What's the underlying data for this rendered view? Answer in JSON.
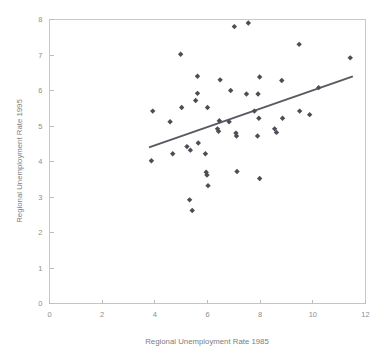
{
  "chart_data": {
    "type": "scatter",
    "title": "",
    "xlabel": "Regional Unemployment Rate 1985",
    "ylabel": "Regional Unemployment Rate 1995",
    "xlim": [
      0,
      12
    ],
    "ylim": [
      0,
      8
    ],
    "xticks": [
      0,
      2,
      4,
      6,
      8,
      10,
      12
    ],
    "yticks": [
      0,
      1,
      2,
      3,
      4,
      5,
      6,
      7,
      8
    ],
    "xtick_labels": [
      "0",
      "2",
      "4",
      "6",
      "8",
      "10",
      "12"
    ],
    "ytick_labels": [
      "0",
      "1",
      "2",
      "3",
      "4",
      "5",
      "6",
      "7",
      "8"
    ],
    "grid": false,
    "legend": null,
    "legend_position": "none",
    "marker_style": "diamond",
    "marker_color": "#4d4d55",
    "series": [
      {
        "name": "Regions",
        "points": [
          [
            3.87,
            4.02
          ],
          [
            3.92,
            5.42
          ],
          [
            4.58,
            5.12
          ],
          [
            4.68,
            4.22
          ],
          [
            4.98,
            7.02
          ],
          [
            5.02,
            5.52
          ],
          [
            5.22,
            4.42
          ],
          [
            5.32,
            2.92
          ],
          [
            5.35,
            4.32
          ],
          [
            5.42,
            2.62
          ],
          [
            5.55,
            5.72
          ],
          [
            5.62,
            6.4
          ],
          [
            5.62,
            5.92
          ],
          [
            5.65,
            4.52
          ],
          [
            5.92,
            4.22
          ],
          [
            5.95,
            3.7
          ],
          [
            5.98,
            3.62
          ],
          [
            6.0,
            5.52
          ],
          [
            6.02,
            3.32
          ],
          [
            6.38,
            4.92
          ],
          [
            6.42,
            4.85
          ],
          [
            6.45,
            5.15
          ],
          [
            6.48,
            6.3
          ],
          [
            6.82,
            5.12
          ],
          [
            6.88,
            6.0
          ],
          [
            7.02,
            7.8
          ],
          [
            7.08,
            4.8
          ],
          [
            7.1,
            4.72
          ],
          [
            7.12,
            3.72
          ],
          [
            7.48,
            5.9
          ],
          [
            7.55,
            7.9
          ],
          [
            7.78,
            5.42
          ],
          [
            7.9,
            4.72
          ],
          [
            7.92,
            5.9
          ],
          [
            7.95,
            5.22
          ],
          [
            7.98,
            6.38
          ],
          [
            7.98,
            3.52
          ],
          [
            8.55,
            4.92
          ],
          [
            8.62,
            4.82
          ],
          [
            8.82,
            6.28
          ],
          [
            8.85,
            5.22
          ],
          [
            9.48,
            7.3
          ],
          [
            9.5,
            5.42
          ],
          [
            9.88,
            5.32
          ],
          [
            10.22,
            6.08
          ],
          [
            11.42,
            6.92
          ]
        ]
      }
    ],
    "trendline": {
      "name": "Linear fit",
      "x_start": 3.78,
      "y_start": 4.4,
      "x_end": 11.52,
      "y_end": 6.4,
      "color": "#595961"
    }
  }
}
